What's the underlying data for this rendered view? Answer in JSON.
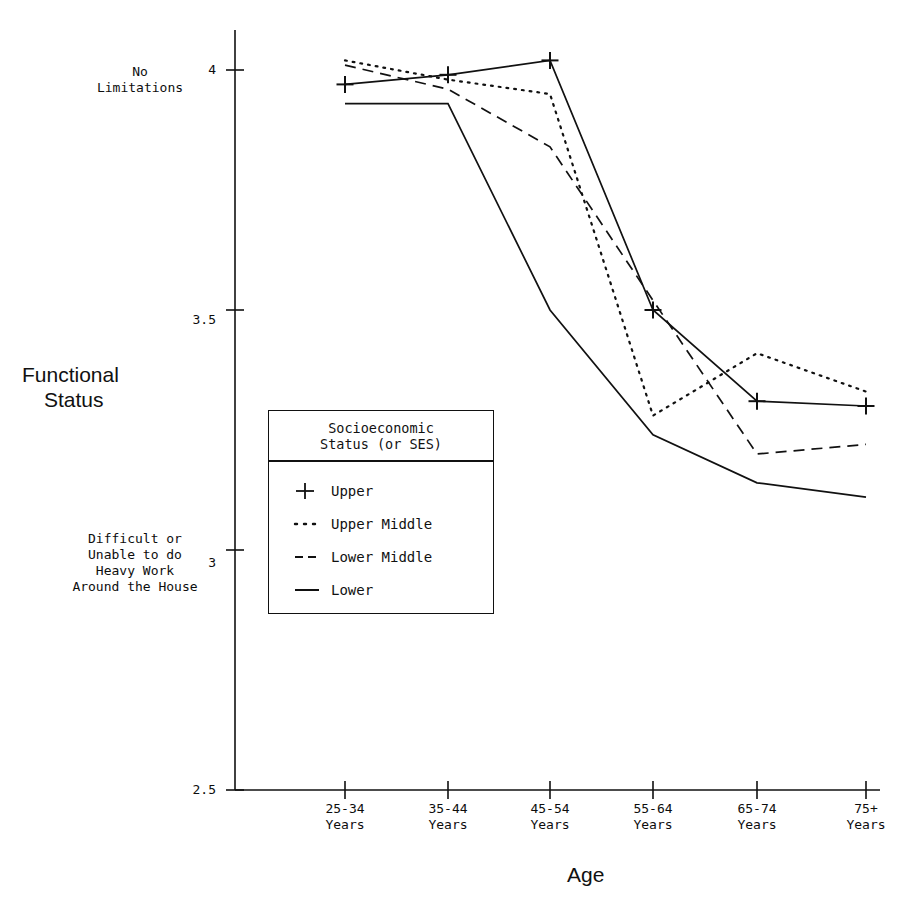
{
  "chart_data": {
    "type": "line",
    "title": "",
    "xlabel": "Age",
    "ylabel": "Functional Status",
    "categories": [
      "25-34\nYears",
      "35-44\nYears",
      "45-54\nYears",
      "55-64\nYears",
      "65-74\nYears",
      "75+\nYears"
    ],
    "x_tick_labels": [
      "25-34",
      "35-44",
      "45-54",
      "55-64",
      "65-74",
      "75+"
    ],
    "x_tick_sublabel": "Years",
    "y_tick_labels": [
      "2.5",
      "3",
      "3.5",
      "4"
    ],
    "y_tick_values": [
      2.5,
      3,
      3.5,
      4
    ],
    "ylim": [
      2.5,
      4.08
    ],
    "grid": false,
    "legend_position": "center-left-inside",
    "y_annotation_top": "No\nLimitations",
    "y_annotation_bottom": "Difficult or\nUnable to do\nHeavy Work\nAround the House",
    "series": [
      {
        "name": "Upper",
        "style": "solid-plus",
        "values": [
          3.97,
          3.99,
          4.02,
          3.5,
          3.31,
          3.3
        ]
      },
      {
        "name": "Upper Middle",
        "style": "dotted",
        "values": [
          4.02,
          3.98,
          3.95,
          3.28,
          3.41,
          3.33
        ]
      },
      {
        "name": "Lower Middle",
        "style": "dashed",
        "values": [
          4.01,
          3.96,
          3.84,
          3.52,
          3.2,
          3.22
        ]
      },
      {
        "name": "Lower",
        "style": "solid",
        "values": [
          3.93,
          3.93,
          3.5,
          3.24,
          3.14,
          3.11
        ]
      }
    ]
  },
  "legend": {
    "title_line1": "Socioeconomic",
    "title_line2": "Status (or SES)",
    "items": [
      {
        "label": "Upper",
        "key": "plus-solid-line-key"
      },
      {
        "label": "Upper Middle",
        "key": "dotted-line-key"
      },
      {
        "label": "Lower Middle",
        "key": "dashed-line-key"
      },
      {
        "label": "Lower",
        "key": "solid-line-key"
      }
    ]
  },
  "axes": {
    "y_title_line1": "Functional",
    "y_title_line2": "Status",
    "x_title": "Age",
    "y_labels": {
      "t4": "4",
      "t35": "3.5",
      "t3": "3",
      "t25": "2.5"
    },
    "annotation_top_line1": "No",
    "annotation_top_line2": "Limitations",
    "annotation_bottom_line1": "Difficult or",
    "annotation_bottom_line2": "Unable to do",
    "annotation_bottom_line3": "Heavy Work",
    "annotation_bottom_line4": "Around the House",
    "x_labels": [
      {
        "range": "25-34",
        "unit": "Years"
      },
      {
        "range": "35-44",
        "unit": "Years"
      },
      {
        "range": "45-54",
        "unit": "Years"
      },
      {
        "range": "55-64",
        "unit": "Years"
      },
      {
        "range": "65-74",
        "unit": "Years"
      },
      {
        "range": "75+",
        "unit": "Years"
      }
    ]
  },
  "colors": {
    "ink": "#111111",
    "background": "#ffffff"
  }
}
